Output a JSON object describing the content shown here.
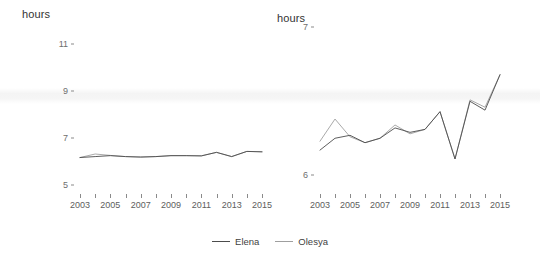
{
  "figure": {
    "background_color": "#ffffff",
    "width": 540,
    "height": 263
  },
  "legend": {
    "position": "bottom-center",
    "entries": [
      {
        "label": "Elena",
        "color": "#4c4c4c"
      },
      {
        "label": "Olesya",
        "color": "#9f9f9f"
      }
    ]
  },
  "panels": {
    "left": {
      "axis_title": "hours"
    },
    "right": {
      "axis_title": "hours"
    }
  },
  "chart_data": [
    {
      "panel": "left",
      "type": "line",
      "title": "",
      "subtitle": "",
      "xlabel": "",
      "ylabel": "hours",
      "grid": false,
      "legend_position": "bottom-center",
      "x": [
        2003,
        2004,
        2005,
        2006,
        2007,
        2008,
        2009,
        2010,
        2011,
        2012,
        2013,
        2014,
        2015
      ],
      "xtick_labels": [
        "2003",
        "2005",
        "2007",
        "2009",
        "2011",
        "2013",
        "2015"
      ],
      "xtick_values": [
        2003,
        2005,
        2007,
        2009,
        2011,
        2013,
        2015
      ],
      "xlim": [
        2003,
        2015
      ],
      "ytick_labels": [
        "5",
        "7",
        "9",
        "11"
      ],
      "ytick_values": [
        5,
        7,
        9,
        11
      ],
      "ylim": [
        4.8,
        11.6
      ],
      "series": [
        {
          "name": "Elena",
          "color": "#4c4c4c",
          "values": [
            6.18,
            6.22,
            6.26,
            6.22,
            6.2,
            6.22,
            6.26,
            6.26,
            6.25,
            6.4,
            6.22,
            6.44,
            6.42,
            6.52
          ]
        },
        {
          "name": "Olesya",
          "color": "#9f9f9f",
          "values": [
            6.18,
            6.33,
            6.27,
            6.22,
            6.2,
            6.22,
            6.26,
            6.26,
            6.25,
            6.4,
            6.22,
            6.44,
            6.43,
            6.55
          ]
        }
      ]
    },
    {
      "panel": "right",
      "type": "line",
      "title": "",
      "subtitle": "",
      "xlabel": "",
      "ylabel": "hours",
      "grid": false,
      "legend_position": "bottom-center",
      "x": [
        2003,
        2004,
        2005,
        2006,
        2007,
        2008,
        2009,
        2010,
        2011,
        2012,
        2013,
        2014,
        2015
      ],
      "xtick_labels": [
        "2003",
        "2005",
        "2007",
        "2009",
        "2011",
        "2013",
        "2015"
      ],
      "xtick_values": [
        2003,
        2005,
        2007,
        2009,
        2011,
        2013,
        2015
      ],
      "xlim": [
        2003,
        2015
      ],
      "ytick_labels": [
        "6",
        "7"
      ],
      "ytick_values": [
        6,
        7
      ],
      "ylim": [
        5.9,
        7.05
      ],
      "series": [
        {
          "name": "Elena",
          "color": "#4c4c4c",
          "values": [
            6.17,
            6.25,
            6.27,
            6.22,
            6.25,
            6.32,
            6.29,
            6.31,
            6.43,
            6.11,
            6.5,
            6.44,
            6.68
          ]
        },
        {
          "name": "Olesya",
          "color": "#9f9f9f",
          "values": [
            6.23,
            6.38,
            6.26,
            6.22,
            6.25,
            6.34,
            6.28,
            6.31,
            6.43,
            6.11,
            6.51,
            6.46,
            6.68
          ]
        }
      ]
    }
  ]
}
